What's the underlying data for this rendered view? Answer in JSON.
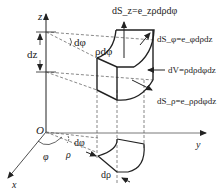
{
  "figure": {
    "axes": {
      "x_label": "x",
      "y_label": "y",
      "z_label": "z",
      "origin_label": "O"
    },
    "angles": {
      "phi_label": "φ",
      "dphi_top_label": "dφ",
      "dphi_bottom_label": "dφ"
    },
    "lengths": {
      "rho_label": "ρ",
      "drho_label": "dρ",
      "dz_label": "dz",
      "rho_dphi_label": "ρdφ"
    },
    "annotations": {
      "dS_z": "dS_z=e_zρdρdφ",
      "dS_phi": "dS_φ=e_φdρdz",
      "dV": "dV=ρdρdφdz",
      "dS_rho": "dS_ρ=e_ρρdφdz"
    },
    "colors": {
      "line": "#222222",
      "dashed": "#555555",
      "background": "#ffffff"
    }
  }
}
